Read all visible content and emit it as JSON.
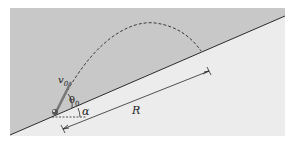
{
  "diagram": {
    "type": "projectile-on-incline",
    "colors": {
      "background": "#ffffff",
      "sky_region": "#c8c8c8",
      "incline_region": "#ececec",
      "line": "#2a2a2a",
      "projectile": "#555555"
    },
    "labels": {
      "initial_velocity": "v",
      "initial_velocity_sub": "0",
      "launch_angle": "θ",
      "launch_angle_sub": "0",
      "incline_angle": "α",
      "range": "R"
    },
    "geometry": {
      "incline_start": [
        10,
        135
      ],
      "incline_end": [
        285,
        16
      ],
      "launch_point": [
        55,
        115
      ],
      "trajectory_peak": [
        155,
        23
      ],
      "landing_point": [
        201,
        51
      ],
      "range_line_start": [
        63,
        129
      ],
      "range_line_end": [
        209,
        71
      ]
    }
  }
}
